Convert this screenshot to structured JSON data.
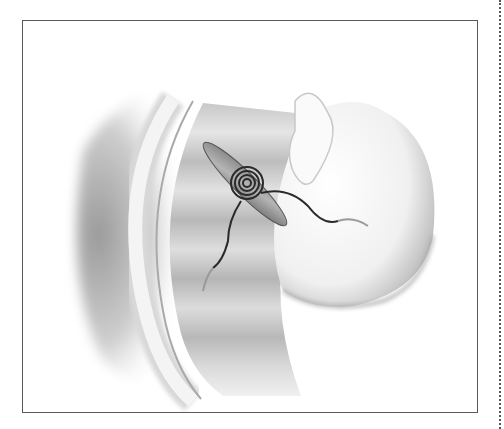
{
  "figure": {
    "caption_visible": "",
    "colors": {
      "frame": "#5a5a5a",
      "tissue_dark": "#8a8a8a",
      "tissue_light": "#e6e6e6",
      "suture": "#2a2a2a",
      "background": "#ffffff"
    }
  }
}
